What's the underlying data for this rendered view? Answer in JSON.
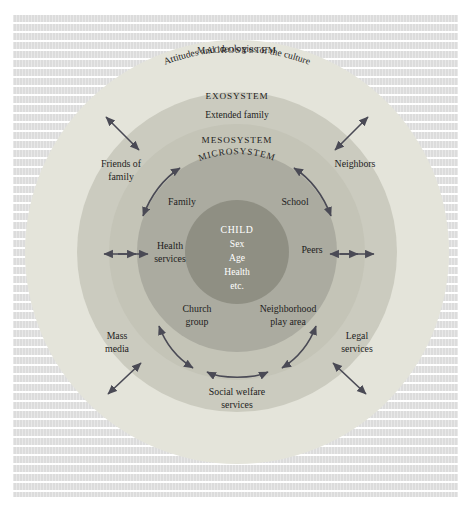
{
  "figure": {
    "background_color": "#dcdcdc",
    "frame_color": "#ffffff"
  },
  "rings": [
    {
      "key": "macrosystem",
      "label": "MACROSYSTEM",
      "sublabel": "Attitudes and ideologies of the culture",
      "color": "#e2e2d8",
      "radius": 212
    },
    {
      "key": "exosystem",
      "label": "EXOSYSTEM",
      "sublabel": "Extended family",
      "color": "#c9c9bd",
      "radius": 160
    },
    {
      "key": "mesosystem",
      "label": "MESOSYSTEM",
      "sublabel": "",
      "color": "#c9c9bd",
      "radius": 128
    },
    {
      "key": "microsystem",
      "label": "MICROSYSTEM",
      "sublabel": "",
      "color": "#a9a99c",
      "radius": 100
    },
    {
      "key": "child",
      "label": "CHILD",
      "sublabel": "",
      "color": "#8d8d80",
      "radius": 52
    }
  ],
  "center": {
    "name": "child-core",
    "lines": [
      "CHILD",
      "Sex",
      "Age",
      "Health",
      "etc."
    ]
  },
  "nodes": [
    {
      "key": "family",
      "lines": [
        "Family"
      ],
      "ring": "microsystem"
    },
    {
      "key": "school",
      "lines": [
        "School"
      ],
      "ring": "microsystem"
    },
    {
      "key": "health-services",
      "lines": [
        "Health",
        "services"
      ],
      "ring": "microsystem"
    },
    {
      "key": "peers",
      "lines": [
        "Peers"
      ],
      "ring": "microsystem"
    },
    {
      "key": "church-group",
      "lines": [
        "Church",
        "group"
      ],
      "ring": "microsystem"
    },
    {
      "key": "neighborhood-play",
      "lines": [
        "Neighborhood",
        "play area"
      ],
      "ring": "microsystem"
    },
    {
      "key": "friends-of-family",
      "lines": [
        "Friends of",
        "family"
      ],
      "ring": "exosystem"
    },
    {
      "key": "neighbors",
      "lines": [
        "Neighbors"
      ],
      "ring": "exosystem"
    },
    {
      "key": "mass-media",
      "lines": [
        "Mass",
        "media"
      ],
      "ring": "exosystem"
    },
    {
      "key": "legal-services",
      "lines": [
        "Legal",
        "services"
      ],
      "ring": "exosystem"
    },
    {
      "key": "social-welfare",
      "lines": [
        "Social welfare",
        "services"
      ],
      "ring": "exosystem"
    }
  ],
  "arrows": {
    "color": "#4a4a55",
    "items": [
      {
        "name": "arrow-health-services",
        "style": "straight-double"
      },
      {
        "name": "arrow-peers",
        "style": "straight-double"
      },
      {
        "name": "arrow-friends-family",
        "style": "curved-double"
      },
      {
        "name": "arrow-neighbors",
        "style": "curved-double"
      },
      {
        "name": "arrow-church-group",
        "style": "curved-double"
      },
      {
        "name": "arrow-neighborhood",
        "style": "curved-double"
      },
      {
        "name": "arrow-social-welfare",
        "style": "curved-double"
      },
      {
        "name": "arrow-macro-left",
        "style": "diagonal-double"
      },
      {
        "name": "arrow-macro-right",
        "style": "diagonal-double"
      },
      {
        "name": "arrow-mass-media",
        "style": "diagonal-double"
      },
      {
        "name": "arrow-legal-services",
        "style": "diagonal-double"
      }
    ]
  }
}
